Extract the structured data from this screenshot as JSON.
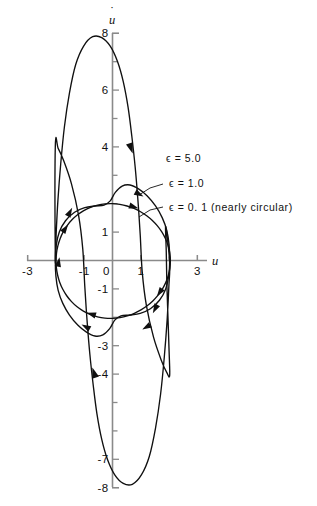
{
  "figure": {
    "title": "",
    "background": "#ffffff",
    "curve_color": "#101010",
    "axis_color": "#8a8a8a"
  },
  "axes": {
    "x_label": "u",
    "y_label": "u̇",
    "y_label_base": "u",
    "y_label_dot": "˙",
    "x_ticklabels": [
      "-3",
      "-1",
      "0",
      "1",
      "3"
    ],
    "x_tickvalues": [
      -3,
      -1,
      0,
      1,
      3
    ],
    "y_ticklabels": [
      "8",
      "6",
      "4",
      "1",
      "-1",
      "-3",
      "-4",
      "-7",
      "-8"
    ],
    "y_tickvalues": [
      8,
      6,
      4,
      1,
      -1,
      -3,
      -4,
      -7,
      -8
    ],
    "x_minor_ticks": [
      -2,
      2
    ],
    "y_minor_ticks": [
      7,
      5,
      3,
      2,
      -2,
      -5,
      -6
    ],
    "xlim": [
      -3.35,
      3.35
    ],
    "ylim": [
      -8.4,
      8.4
    ]
  },
  "legend": [
    {
      "id": "eps5",
      "label": "ϵ = 5.0",
      "has_leader": false
    },
    {
      "id": "eps1",
      "label": "ϵ = 1.0",
      "has_leader": true
    },
    {
      "id": "eps01",
      "label": "ϵ = 0. 1 (nearly circular)",
      "has_leader": true
    }
  ],
  "chart_data": {
    "type": "line",
    "title": "",
    "xlabel": "u",
    "ylabel": "u̇",
    "xlim": [
      -3.35,
      3.35
    ],
    "ylim": [
      -8.4,
      8.4
    ],
    "grid": false,
    "legend_position": "inline-annotations",
    "series": [
      {
        "name": "ϵ = 5.0",
        "epsilon": 5.0,
        "closed": true,
        "shape": "relaxation oscillation, tall narrow loop",
        "x_extent": [
          -2.02,
          2.02
        ],
        "y_extent": [
          -7.9,
          7.9
        ],
        "points": [
          [
            -2.02,
            0.05
          ],
          [
            -1.99,
            0.95
          ],
          [
            -1.93,
            2.1
          ],
          [
            -1.83,
            3.4
          ],
          [
            -1.7,
            4.7
          ],
          [
            -1.52,
            5.9
          ],
          [
            -1.3,
            6.9
          ],
          [
            -1.02,
            7.55
          ],
          [
            -0.7,
            7.88
          ],
          [
            -0.38,
            7.85
          ],
          [
            -0.08,
            7.55
          ],
          [
            0.18,
            7.0
          ],
          [
            0.38,
            6.3
          ],
          [
            0.55,
            5.4
          ],
          [
            0.68,
            4.4
          ],
          [
            0.8,
            3.3
          ],
          [
            0.9,
            2.1
          ],
          [
            0.98,
            0.9
          ],
          [
            1.05,
            -0.4
          ],
          [
            1.2,
            -1.6
          ],
          [
            1.45,
            -2.7
          ],
          [
            1.72,
            -3.5
          ],
          [
            1.92,
            -3.95
          ],
          [
            2.02,
            -4.05
          ],
          [
            2.0,
            -3.2
          ],
          [
            1.96,
            -2.0
          ],
          [
            1.92,
            -0.8
          ],
          [
            1.9,
            0.3
          ],
          [
            1.88,
            1.2
          ]
        ],
        "points_lower": [
          [
            2.02,
            -0.05
          ],
          [
            1.99,
            -0.95
          ],
          [
            1.93,
            -2.1
          ],
          [
            1.83,
            -3.4
          ],
          [
            1.7,
            -4.7
          ],
          [
            1.52,
            -5.9
          ],
          [
            1.3,
            -6.9
          ],
          [
            1.02,
            -7.55
          ],
          [
            0.7,
            -7.88
          ],
          [
            0.38,
            -7.85
          ],
          [
            0.08,
            -7.55
          ],
          [
            -0.18,
            -7.0
          ],
          [
            -0.38,
            -6.3
          ],
          [
            -0.55,
            -5.4
          ],
          [
            -0.68,
            -4.4
          ],
          [
            -0.8,
            -3.3
          ],
          [
            -0.9,
            -2.1
          ],
          [
            -0.98,
            -0.9
          ],
          [
            -1.05,
            0.4
          ],
          [
            -1.2,
            1.6
          ],
          [
            -1.45,
            2.7
          ],
          [
            -1.72,
            3.5
          ],
          [
            -1.92,
            3.95
          ],
          [
            -2.02,
            4.05
          ]
        ],
        "arrow_positions": [
          [
            0.6,
            4.05
          ],
          [
            -1.38,
            -4.05
          ]
        ],
        "arrow_directions": [
          "down-right",
          "up-left"
        ]
      },
      {
        "name": "ϵ = 1.0",
        "epsilon": 1.0,
        "closed": true,
        "shape": "distorted oval",
        "x_extent": [
          -2.02,
          2.02
        ],
        "y_extent": [
          -2.68,
          2.68
        ],
        "arrow_positions": [
          [
            0.75,
            2.25
          ],
          [
            -0.75,
            -2.25
          ],
          [
            -1.4,
            1.2
          ],
          [
            1.4,
            -1.2
          ]
        ],
        "arrow_directions": [
          "down-right",
          "up-left",
          "up-right",
          "down-left"
        ]
      },
      {
        "name": "ϵ = 0. 1 (nearly circular)",
        "epsilon": 0.1,
        "closed": true,
        "shape": "nearly circular",
        "radius": 2.02,
        "center": [
          0.0,
          0.0
        ],
        "x_extent": [
          -2.02,
          2.02
        ],
        "y_extent": [
          -2.02,
          2.02
        ],
        "arrow_positions": [
          [
            1.05,
            1.72
          ],
          [
            -1.05,
            -1.72
          ],
          [
            -1.85,
            0.8
          ],
          [
            1.85,
            -0.8
          ]
        ],
        "arrow_directions": [
          "down-right",
          "up-left",
          "up-right",
          "down-left"
        ]
      }
    ]
  }
}
